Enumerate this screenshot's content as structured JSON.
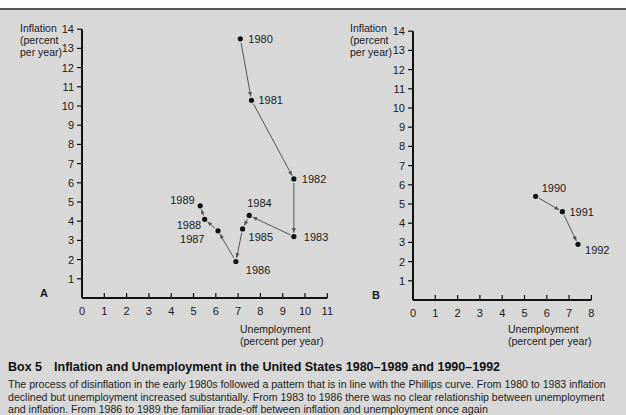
{
  "caption": {
    "box_label": "Box 5",
    "title": "Inflation and Unemployment in the United States 1980–1989 and 1990–1992",
    "body": "The process of disinflation in the early 1980s followed a pattern that is in line with the Phillips curve. From 1980 to 1983 inflation declined but unemployment increased substantially. From 1983 to 1986 there was no clear relationship between unemployment and inflation. From 1986 to 1989 the familiar trade-off between inflation and unemployment once again"
  },
  "colors": {
    "background": "#d8d8d8",
    "ink": "#1a1a1a",
    "arrow": "#555555"
  },
  "chart_data": [
    {
      "type": "scatter",
      "panel_label": "A",
      "title": "",
      "ylabel": "Inflation (percent per year)",
      "ylabel_lines": [
        "Inflation",
        "(percent",
        "per year)"
      ],
      "xlabel": "Unemployment (percent per year)",
      "xlabel_lines": [
        "Unemployment",
        "(percent per year)"
      ],
      "xlim": [
        0,
        11
      ],
      "ylim": [
        0,
        14
      ],
      "xticks": [
        0,
        1,
        2,
        3,
        4,
        5,
        6,
        7,
        8,
        9,
        10,
        11
      ],
      "yticks": [
        1,
        2,
        3,
        4,
        5,
        6,
        7,
        8,
        9,
        10,
        11,
        12,
        13,
        14
      ],
      "grid": false,
      "connected_with_arrows": true,
      "points": [
        {
          "label": "1980",
          "x": 7.1,
          "y": 13.5
        },
        {
          "label": "1981",
          "x": 7.6,
          "y": 10.3
        },
        {
          "label": "1982",
          "x": 9.5,
          "y": 6.2
        },
        {
          "label": "1983",
          "x": 9.5,
          "y": 3.2
        },
        {
          "label": "1984",
          "x": 7.5,
          "y": 4.3
        },
        {
          "label": "1985",
          "x": 7.2,
          "y": 3.6
        },
        {
          "label": "1986",
          "x": 6.9,
          "y": 1.9
        },
        {
          "label": "1987",
          "x": 6.1,
          "y": 3.5
        },
        {
          "label": "1988",
          "x": 5.5,
          "y": 4.1
        },
        {
          "label": "1989",
          "x": 5.3,
          "y": 4.8
        }
      ]
    },
    {
      "type": "scatter",
      "panel_label": "B",
      "title": "",
      "ylabel": "Inflation (percent per year)",
      "ylabel_lines": [
        "Inflation",
        "(percent",
        "per year)"
      ],
      "xlabel": "Unemployment (percent per year)",
      "xlabel_lines": [
        "Unemployment",
        "(percent per year)"
      ],
      "xlim": [
        0,
        8
      ],
      "ylim": [
        0,
        14
      ],
      "xticks": [
        0,
        1,
        2,
        3,
        4,
        5,
        6,
        7,
        8
      ],
      "yticks": [
        1,
        2,
        3,
        4,
        5,
        6,
        7,
        8,
        9,
        10,
        11,
        12,
        13,
        14
      ],
      "grid": false,
      "connected_with_arrows": true,
      "points": [
        {
          "label": "1990",
          "x": 5.5,
          "y": 5.4
        },
        {
          "label": "1991",
          "x": 6.7,
          "y": 4.6
        },
        {
          "label": "1992",
          "x": 7.4,
          "y": 2.9
        }
      ]
    }
  ]
}
